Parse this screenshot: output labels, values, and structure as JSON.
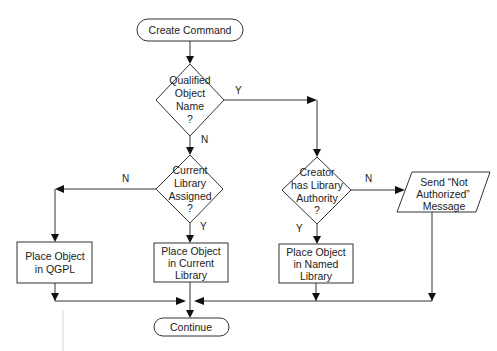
{
  "diagram": {
    "type": "flowchart",
    "nodes": {
      "start": {
        "kind": "terminator",
        "label": "Create Command"
      },
      "qualified": {
        "kind": "decision",
        "lines": [
          "Qualified",
          "Object",
          "Name",
          "?"
        ]
      },
      "current_lib": {
        "kind": "decision",
        "lines": [
          "Current",
          "Library",
          "Assigned",
          "?"
        ]
      },
      "creator_auth": {
        "kind": "decision",
        "lines": [
          "Creator",
          "has Library",
          "Authority",
          "?"
        ]
      },
      "place_qgpl": {
        "kind": "process",
        "lines": [
          "Place Object",
          "in QGPL"
        ]
      },
      "place_current": {
        "kind": "process",
        "lines": [
          "Place Object",
          "in Current",
          "Library"
        ]
      },
      "place_named": {
        "kind": "process",
        "lines": [
          "Place Object",
          "in Named",
          "Library"
        ]
      },
      "not_auth": {
        "kind": "io",
        "lines": [
          "Send “Not",
          "Authorized”",
          "Message"
        ]
      },
      "end": {
        "kind": "terminator",
        "label": "Continue"
      }
    },
    "edges": [
      {
        "from": "start",
        "to": "qualified",
        "label": ""
      },
      {
        "from": "qualified",
        "to": "creator_auth",
        "label": "Y"
      },
      {
        "from": "qualified",
        "to": "current_lib",
        "label": "N"
      },
      {
        "from": "current_lib",
        "to": "place_qgpl",
        "label": "N"
      },
      {
        "from": "current_lib",
        "to": "place_current",
        "label": "Y"
      },
      {
        "from": "creator_auth",
        "to": "not_auth",
        "label": "N"
      },
      {
        "from": "creator_auth",
        "to": "place_named",
        "label": "Y"
      },
      {
        "from": "place_qgpl",
        "to": "end",
        "label": ""
      },
      {
        "from": "place_current",
        "to": "end",
        "label": ""
      },
      {
        "from": "place_named",
        "to": "end",
        "label": ""
      },
      {
        "from": "not_auth",
        "to": "end",
        "label": ""
      }
    ],
    "edge_labels": {
      "qualified_yes": "Y",
      "qualified_no": "N",
      "current_no": "N",
      "current_yes": "Y",
      "creator_no": "N",
      "creator_yes": "Y"
    }
  }
}
